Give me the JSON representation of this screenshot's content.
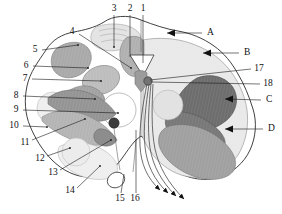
{
  "figure": {
    "background_color": "#ffffff",
    "outline_color": "#2b2b2b",
    "palette": {
      "white": "#ffffff",
      "very_light_gray": "#e8e8e8",
      "light_gray": "#d4d4d4",
      "mid_light_gray": "#c2c2c2",
      "mid_gray": "#ababab",
      "gray": "#9a9a9a",
      "dark_gray": "#7d7d7d",
      "darkest_gray": "#6a6a6a",
      "ink": "#1a1a1a"
    }
  },
  "labels": {
    "numeric": [
      {
        "id": "1",
        "text": "1",
        "x": 143,
        "y": 9,
        "anchor": "middle"
      },
      {
        "id": "2",
        "text": "2",
        "x": 130,
        "y": 9,
        "anchor": "middle"
      },
      {
        "id": "3",
        "text": "3",
        "x": 114,
        "y": 9,
        "anchor": "middle"
      },
      {
        "id": "4",
        "text": "4",
        "x": 72,
        "y": 32,
        "anchor": "middle"
      },
      {
        "id": "5",
        "text": "5",
        "x": 35,
        "y": 50,
        "anchor": "middle"
      },
      {
        "id": "6",
        "text": "6",
        "x": 26,
        "y": 66,
        "anchor": "middle"
      },
      {
        "id": "7",
        "text": "7",
        "x": 25,
        "y": 79,
        "anchor": "middle"
      },
      {
        "id": "8",
        "text": "8",
        "x": 16,
        "y": 96,
        "anchor": "middle"
      },
      {
        "id": "9",
        "text": "9",
        "x": 16,
        "y": 110,
        "anchor": "middle"
      },
      {
        "id": "10",
        "text": "10",
        "x": 14,
        "y": 126,
        "anchor": "middle"
      },
      {
        "id": "11",
        "text": "11",
        "x": 25,
        "y": 143,
        "anchor": "middle"
      },
      {
        "id": "12",
        "text": "12",
        "x": 40,
        "y": 159,
        "anchor": "middle"
      },
      {
        "id": "13",
        "text": "13",
        "x": 53,
        "y": 173,
        "anchor": "middle"
      },
      {
        "id": "14",
        "text": "14",
        "x": 70,
        "y": 191,
        "anchor": "middle"
      },
      {
        "id": "15",
        "text": "15",
        "x": 120,
        "y": 199,
        "anchor": "middle"
      },
      {
        "id": "16",
        "text": "16",
        "x": 135,
        "y": 199,
        "anchor": "middle"
      },
      {
        "id": "17",
        "text": "17",
        "x": 259,
        "y": 69,
        "anchor": "middle"
      },
      {
        "id": "18",
        "text": "18",
        "x": 268,
        "y": 84,
        "anchor": "middle"
      }
    ],
    "letters": [
      {
        "id": "A",
        "text": "A",
        "x": 207,
        "y": 33
      },
      {
        "id": "B",
        "text": "B",
        "x": 244,
        "y": 53
      },
      {
        "id": "C",
        "text": "C",
        "x": 266,
        "y": 100
      },
      {
        "id": "D",
        "text": "D",
        "x": 268,
        "y": 129
      }
    ]
  },
  "leaders": {
    "numeric": [
      {
        "id": "1",
        "d": "M143,15 L143,63"
      },
      {
        "id": "2",
        "d": "M130,15 L130,57"
      },
      {
        "id": "3",
        "d": "M114,15 L114,47"
      },
      {
        "id": "4",
        "d": "M79,34 L131,68"
      },
      {
        "id": "5",
        "d": "M42,50 L78,45"
      },
      {
        "id": "6",
        "d": "M33,66 L88,68"
      },
      {
        "id": "7",
        "d": "M32,79 L101,81"
      },
      {
        "id": "8",
        "d": "M23,96 L95,99"
      },
      {
        "id": "9",
        "d": "M23,110 L118,113"
      },
      {
        "id": "10",
        "d": "M23,126 L47,127"
      },
      {
        "id": "11",
        "d": "M32,140 L85,119"
      },
      {
        "id": "12",
        "d": "M47,156 L70,148"
      },
      {
        "id": "13",
        "d": "M60,170 L111,140"
      },
      {
        "id": "14",
        "d": "M77,188 L100,166"
      },
      {
        "id": "15",
        "d": "M121,193 L124,174"
      },
      {
        "id": "16",
        "d": "M136,193 L136,130"
      },
      {
        "id": "17",
        "d": "M251,69 L150,80"
      },
      {
        "id": "18",
        "d": "M260,84 L151,82"
      }
    ],
    "letters": [
      {
        "id": "A",
        "d": "M202,33 L164,33",
        "arrow": {
          "x": 160,
          "y": 33,
          "dir": "left"
        }
      },
      {
        "id": "B",
        "d": "M239,53 L200,53",
        "arrow": {
          "x": 196,
          "y": 53,
          "dir": "left"
        }
      },
      {
        "id": "C",
        "d": "M261,100 L222,100",
        "arrow": {
          "x": 218,
          "y": 99,
          "dir": "left"
        }
      },
      {
        "id": "D",
        "d": "M263,129 L222,129",
        "arrow": {
          "x": 218,
          "y": 129,
          "dir": "left"
        }
      }
    ]
  },
  "structures": [
    {
      "name": "outer-boundary",
      "tone": "white"
    },
    {
      "name": "dorsal-columns-left",
      "tone": "very_light_gray"
    },
    {
      "name": "dorsal-nucleus-band",
      "tone": "light_gray"
    },
    {
      "name": "right-hemisection-field",
      "tone": "very_light_gray"
    },
    {
      "name": "left-lateral-nucleus",
      "tone": "mid_gray"
    },
    {
      "name": "left-oval-nucleus-upper",
      "tone": "mid_light_gray"
    },
    {
      "name": "left-oval-nucleus-mid",
      "tone": "mid_gray"
    },
    {
      "name": "left-pale-circle",
      "tone": "white"
    },
    {
      "name": "left-band-upper",
      "tone": "gray"
    },
    {
      "name": "left-band-lower",
      "tone": "mid_gray"
    },
    {
      "name": "left-ventral-field",
      "tone": "very_light_gray"
    },
    {
      "name": "right-dark-tract",
      "tone": "darkest_gray"
    },
    {
      "name": "right-mid-tract",
      "tone": "mid_gray"
    },
    {
      "name": "right-ventral-mass",
      "tone": "gray"
    },
    {
      "name": "central-funnel",
      "tone": "white"
    },
    {
      "name": "median-dark-nucleus",
      "tone": "ink"
    },
    {
      "name": "ventral-rootlet-loop",
      "tone": "white"
    },
    {
      "name": "exiting-fiber-bundle",
      "tone": "ink"
    }
  ]
}
